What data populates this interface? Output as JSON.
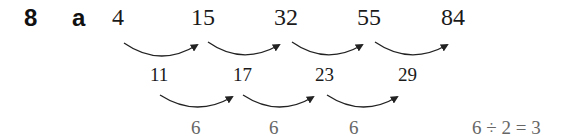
{
  "question": {
    "number": "8",
    "part": "a"
  },
  "sequence": {
    "terms": [
      "4",
      "15",
      "32",
      "55",
      "84"
    ],
    "first_differences": [
      "11",
      "17",
      "23",
      "29"
    ],
    "second_differences": [
      "6",
      "6",
      "6"
    ],
    "calculation": "6 ÷ 2 = 3"
  },
  "colors": {
    "text": "#1a1a1a",
    "second_difference_text": "#666666",
    "arrow": "#222222"
  }
}
